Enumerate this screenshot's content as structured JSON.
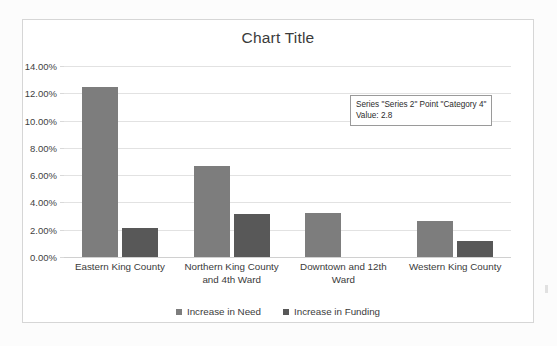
{
  "chart_data": {
    "type": "bar",
    "title": "Chart Title",
    "xlabel": "",
    "ylabel": "",
    "ylim": [
      0,
      14
    ],
    "ytick_labels": [
      "14.00%",
      "12.00%",
      "10.00%",
      "8.00%",
      "6.00%",
      "4.00%",
      "2.00%",
      "0.00%"
    ],
    "ytick_values": [
      14,
      12,
      10,
      8,
      6,
      4,
      2,
      0
    ],
    "grid": true,
    "legend_position": "bottom",
    "value_unit": "percent",
    "categories": [
      "Eastern King County",
      "Northern King County and 4th Ward",
      "Downtown and 12th Ward",
      "Western King County"
    ],
    "series": [
      {
        "name": "Increase in Need",
        "color": "#7d7d7d",
        "values": [
          12.45,
          6.67,
          3.25,
          2.65
        ]
      },
      {
        "name": "Increase in Funding",
        "color": "#585858",
        "values": [
          2.15,
          3.15,
          0,
          1.15
        ]
      }
    ]
  },
  "tooltip": {
    "line1": "Series \"Series 2\" Point \"Category 4\"",
    "line2": "Value: 2.8"
  },
  "colors": {
    "series_1": "#7d7d7d",
    "series_2": "#585858",
    "gridline": "#e2e2e2",
    "frame_border": "#d6d6d6"
  }
}
